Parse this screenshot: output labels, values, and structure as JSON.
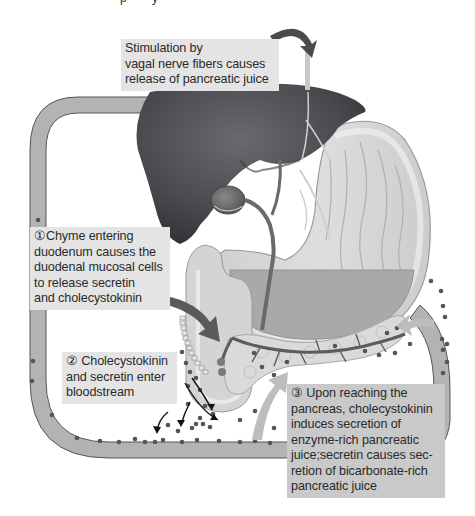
{
  "figure": {
    "header_partial": "· · · p · · · y · ·",
    "structures": [
      "liver",
      "gallbladder",
      "stomach",
      "duodenum",
      "pancreas",
      "pancreatic duct",
      "bile duct",
      "blood vessel loop",
      "vagal nerve"
    ],
    "colors": {
      "liver": "#4a4a4e",
      "stomach_outer": "#d6d6d6",
      "stomach_inner": "#c8c8c8",
      "chyme": "#a9a9a9",
      "vessel": "#b3b3b3",
      "vessel_outline": "#555555",
      "hormone_dot": "#555555",
      "pancreas": "#d9d9d9",
      "duct": "#6a6a6a",
      "arrow_dark": "#4b4b4b",
      "arrow_light": "#bdbdbd",
      "label_bg": "#e4e4e4",
      "label_bg_dark": "#c9c9c9"
    }
  },
  "labels": {
    "vagal": {
      "lines": [
        "Stimulation by",
        "vagal nerve fibers causes",
        "release of pancreatic juice"
      ]
    },
    "step1": {
      "number": "①",
      "lines": [
        "①Chyme entering",
        "duodenum causes the",
        "duodenal mucosal cells",
        "to release secretin",
        "and cholecystokinin"
      ]
    },
    "step2": {
      "number": "②",
      "lines": [
        "② Cholecystokinin",
        "and secretin enter",
        "bloodstream"
      ]
    },
    "step3": {
      "number": "③",
      "lines": [
        "③ Upon reaching the",
        "pancreas, cholecystokinin",
        "induces secretion of",
        "enzyme-rich pancreatic",
        "juice;secretin causes sec-",
        "retion of bicarbonate-rich",
        "pancreatic juice"
      ]
    }
  }
}
